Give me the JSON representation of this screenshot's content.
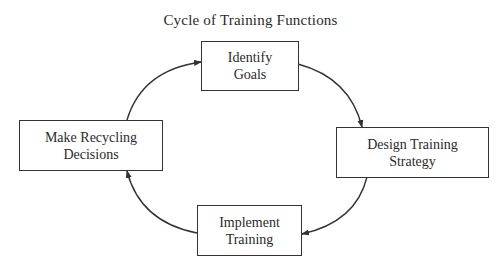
{
  "title": "Cycle of Training Functions",
  "nodes": [
    {
      "id": "identify-goals",
      "line1": "Identify",
      "line2": "Goals"
    },
    {
      "id": "design-training-strategy",
      "line1": "Design Training",
      "line2": "Strategy"
    },
    {
      "id": "implement-training",
      "line1": "Implement",
      "line2": "Training"
    },
    {
      "id": "make-recycling-decisions",
      "line1": "Make Recycling",
      "line2": "Decisions"
    }
  ],
  "edges": [
    {
      "from": "identify-goals",
      "to": "design-training-strategy"
    },
    {
      "from": "design-training-strategy",
      "to": "implement-training"
    },
    {
      "from": "implement-training",
      "to": "make-recycling-decisions"
    },
    {
      "from": "make-recycling-decisions",
      "to": "identify-goals"
    }
  ],
  "colors": {
    "stroke": "#333333",
    "text": "#2a2a2a",
    "background": "#ffffff"
  }
}
